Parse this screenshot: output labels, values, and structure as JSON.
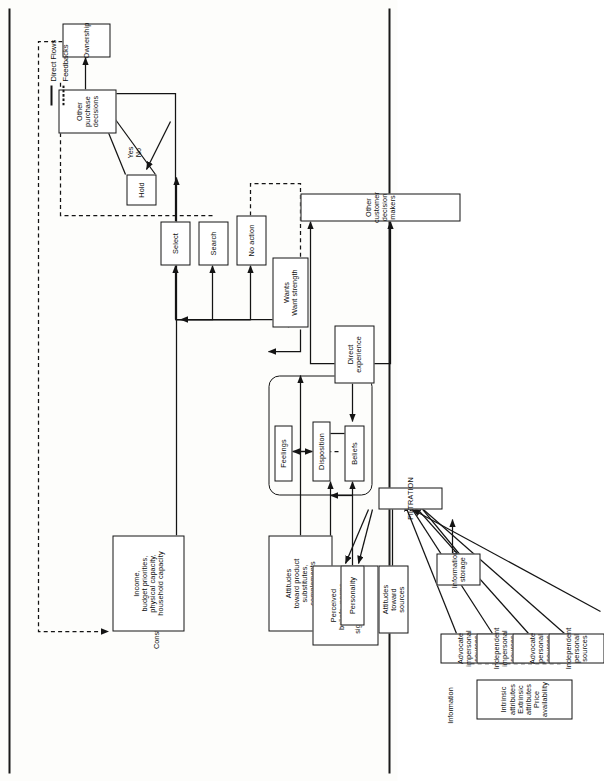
{
  "figure": {
    "kind": "flowchart",
    "orientation": "rotated-90-ccw",
    "title_visible": false
  },
  "legend": {
    "direct_flows_label": "Direct Flows",
    "feedbacks_label": "Feedbacks"
  },
  "labels": {
    "constraints": "Constraints",
    "information": "Information"
  },
  "nodes": {
    "ownership": "Ownership",
    "other_purchase_decisions": "Other\npurchase\ndecisions",
    "hold": "Hold",
    "yes_no": "Yes\nNo",
    "constraints_box": "Income,\nbudget priorities,\nphysical capacity,\nhousehold capacity",
    "select": "Select",
    "search": "Search",
    "no_action": "No action",
    "attitudes_product": "Attitudes\ntoward product\nsubstitutes,\ncomplements",
    "feelings": "Feelings",
    "disposition": "Disposition",
    "beliefs": "Beliefs",
    "wants": "Wants\nWant strength",
    "perceived_beliefs": "Perceived\nbeliefs, norms,\nvalues of\nsignificant others",
    "personality": "Personality",
    "direct_experience": "Direct\nexperience",
    "attitudes_sources": "Attitudes\ntoward\nsources",
    "filtration": "FILTRATION",
    "other_customer_decision_makers": "Other customer decision makers",
    "information_storage": "Information\nstorage",
    "advocate_impersonal": "Advocate\nimpersonal\nsources",
    "independent_impersonal": "Independent\nimpersonal\nsources",
    "advocate_personal": "Advocate\npersonal\nsources",
    "independent_personal": "Independent\npersonal\nsources",
    "information_box": "Intrinsic\nattributes\nExtrinsic\nattributes\nPrice\navailability"
  },
  "colors": {
    "ink": "#141414",
    "paper": "#fdfdfb"
  }
}
